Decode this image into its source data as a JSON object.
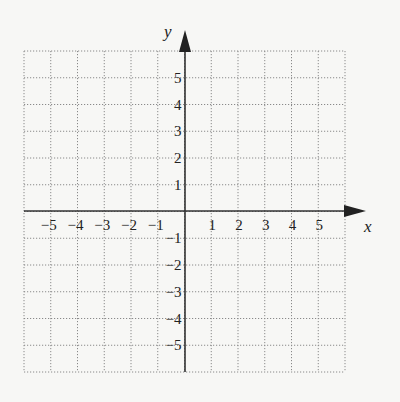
{
  "chart_data": {
    "type": "coordinate-grid",
    "title": "",
    "xlabel": "x",
    "ylabel": "y",
    "xlim": [
      -6,
      6
    ],
    "ylim": [
      -6,
      6
    ],
    "grid": true,
    "grid_style": "dotted",
    "x_ticks": [
      -5,
      -4,
      -3,
      -2,
      -1,
      1,
      2,
      3,
      4,
      5
    ],
    "y_ticks": [
      -5,
      -4,
      -3,
      -2,
      -1,
      1,
      2,
      3,
      4,
      5
    ],
    "x_tick_labels": [
      "−5",
      "−4",
      "−3",
      "−2",
      "−1",
      "1",
      "2",
      "3",
      "4",
      "5"
    ],
    "y_tick_labels": [
      "−5",
      "−4",
      "−3",
      "−2",
      "−1",
      "1",
      "2",
      "3",
      "4",
      "5"
    ],
    "series": []
  },
  "axes": {
    "x_name": "x",
    "y_name": "y",
    "grid_color": "#8a8a8a",
    "axis_color": "#333333"
  }
}
